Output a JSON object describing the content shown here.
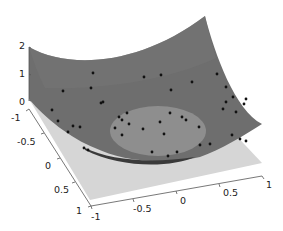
{
  "chart_data": {
    "type": "surface3d",
    "title": "",
    "xlabel": "",
    "ylabel": "",
    "zlabel": "",
    "x_ticks": [
      "-1",
      "-0.5",
      "0",
      "0.5",
      "1"
    ],
    "y_ticks": [
      "-1",
      "-0.5",
      "0",
      "0.5",
      "1"
    ],
    "z_ticks": [
      "0",
      "1",
      "2"
    ],
    "xlim": [
      -1,
      1
    ],
    "ylim": [
      -1,
      1
    ],
    "zlim": [
      0,
      2
    ],
    "grid": false,
    "series": [
      {
        "name": "surface",
        "kind": "surface",
        "formula": "z = x^2 + y^2",
        "color": "#6f6f6f"
      },
      {
        "name": "plane",
        "kind": "plane",
        "z": 0,
        "color": "#d4d4d4"
      },
      {
        "name": "disc",
        "kind": "ellipse-region",
        "color": "#8c8c8c"
      },
      {
        "name": "points",
        "kind": "scatter",
        "color": "#000000",
        "count": 45
      }
    ]
  },
  "colors": {
    "surface": "#6e6e6e",
    "surface_light": "#7c7c7c",
    "plane": "#d6d6d6",
    "disc": "#8e8e8e",
    "shadow": "#3e3e3e",
    "points": "#111111",
    "axis": "#555555"
  },
  "axes": {
    "z": {
      "ticks": [
        {
          "label": "2"
        },
        {
          "label": "1"
        },
        {
          "label": "0"
        }
      ]
    },
    "y": {
      "ticks": [
        {
          "label": "-1"
        },
        {
          "label": "-0.5"
        },
        {
          "label": "0"
        },
        {
          "label": "0.5"
        },
        {
          "label": "1"
        }
      ]
    },
    "x": {
      "ticks": [
        {
          "label": "-1"
        },
        {
          "label": "-0.5"
        },
        {
          "label": "0"
        },
        {
          "label": "0.5"
        },
        {
          "label": "1"
        }
      ]
    }
  },
  "points": [
    [
      93,
      73
    ],
    [
      63,
      91
    ],
    [
      91,
      88
    ],
    [
      101,
      103
    ],
    [
      103,
      102
    ],
    [
      52,
      110
    ],
    [
      58,
      121
    ],
    [
      73,
      126
    ],
    [
      80,
      127
    ],
    [
      68,
      132
    ],
    [
      88,
      150
    ],
    [
      84,
      148
    ],
    [
      115,
      128
    ],
    [
      122,
      120
    ],
    [
      119,
      117
    ],
    [
      127,
      113
    ],
    [
      129,
      124
    ],
    [
      122,
      135
    ],
    [
      143,
      129
    ],
    [
      160,
      122
    ],
    [
      164,
      134
    ],
    [
      170,
      113
    ],
    [
      182,
      117
    ],
    [
      186,
      120
    ],
    [
      199,
      127
    ],
    [
      171,
      90
    ],
    [
      192,
      82
    ],
    [
      144,
      77
    ],
    [
      161,
      75
    ],
    [
      217,
      74
    ],
    [
      226,
      87
    ],
    [
      233,
      97
    ],
    [
      226,
      102
    ],
    [
      223,
      109
    ],
    [
      236,
      112
    ],
    [
      246,
      99
    ],
    [
      244,
      104
    ],
    [
      232,
      135
    ],
    [
      240,
      139
    ],
    [
      246,
      141
    ],
    [
      200,
      145
    ],
    [
      210,
      144
    ],
    [
      177,
      152
    ],
    [
      168,
      156
    ],
    [
      152,
      152
    ]
  ]
}
